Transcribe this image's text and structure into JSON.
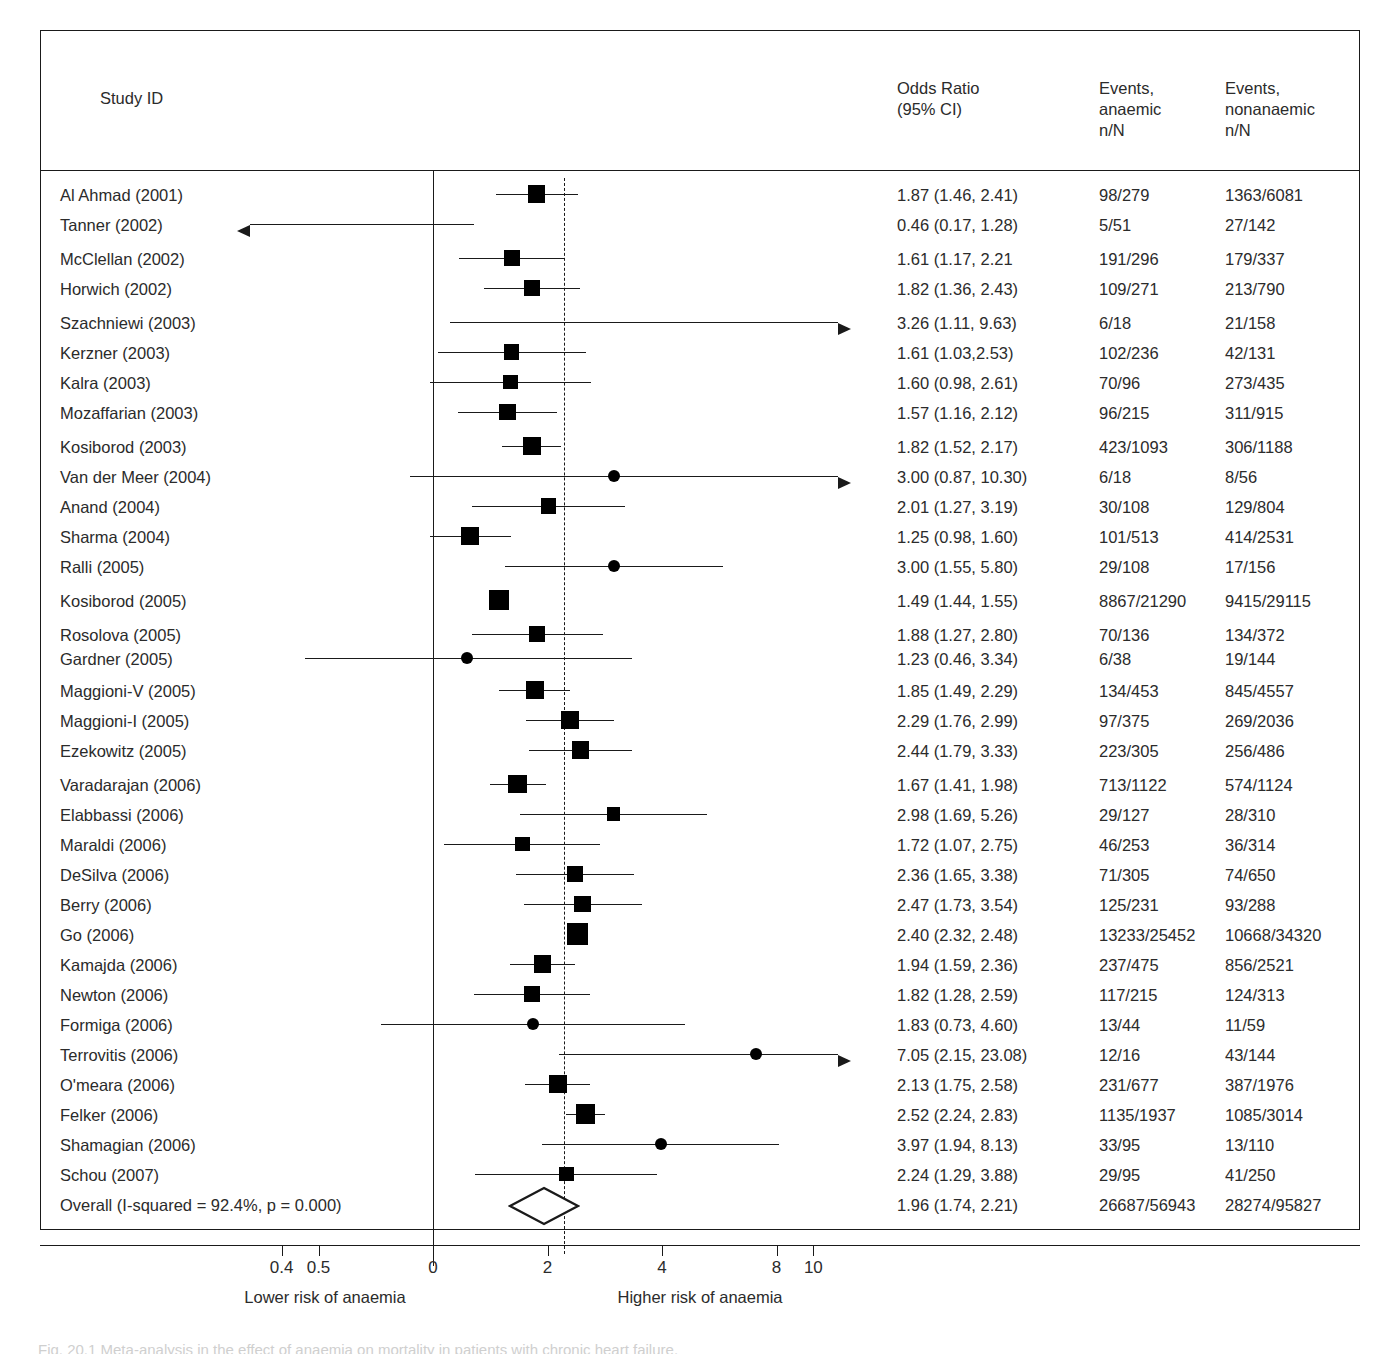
{
  "header": {
    "study_id": "Study ID",
    "odds_ratio": "Odds Ratio\n(95% CI)",
    "events_anaemic": "Events,\nanaemic\nn/N",
    "events_nonanaemic": "Events,\nnonanaemic\nn/N"
  },
  "axis": {
    "ticks": [
      {
        "label": "0.4",
        "value": 0.4
      },
      {
        "label": "0.5",
        "value": 0.5
      },
      {
        "label": "0",
        "value": 1
      },
      {
        "label": "2",
        "value": 2
      },
      {
        "label": "4",
        "value": 4
      },
      {
        "label": "8",
        "value": 8
      },
      {
        "label": "10",
        "value": 10
      }
    ],
    "left_label": "Lower risk of anaemia",
    "right_label": "Higher risk of anaemia",
    "no_effect_line": 1,
    "summary_line": 1.96
  },
  "caption": "Fig. 20.1  Meta-analysis in the effect of anaemia on mortality in patients with chronic heart failure.",
  "chart_data": {
    "type": "forest",
    "title": "",
    "xlabel": "Odds Ratio (95% CI)",
    "xscale": "log",
    "xlim": [
      0.33,
      12
    ],
    "grid": false,
    "effect_measure": "Odds Ratio",
    "rows": [
      {
        "study": "Al Ahmad (2001)",
        "or": 1.87,
        "lo": 1.46,
        "hi": 2.41,
        "or_text": "1.87 (1.46, 2.41)",
        "events_anaemic": "98/279",
        "events_nonanaemic": "1363/6081",
        "weight": 4.0,
        "marker": "square"
      },
      {
        "study": "Tanner (2002)",
        "or": 0.46,
        "lo": 0.17,
        "hi": 1.28,
        "or_text": "0.46 (0.17, 1.28)",
        "events_anaemic": "5/51",
        "events_nonanaemic": "27/142",
        "weight": 0.6,
        "marker": "none",
        "clip_left": true
      },
      {
        "study": "McClellan (2002)",
        "or": 1.61,
        "lo": 1.17,
        "hi": 2.21,
        "or_text": "1.61 (1.17, 2.21",
        "events_anaemic": "191/296",
        "events_nonanaemic": "179/337",
        "weight": 3.6,
        "marker": "square"
      },
      {
        "study": "Horwich (2002)",
        "or": 1.82,
        "lo": 1.36,
        "hi": 2.43,
        "or_text": "1.82 (1.36, 2.43)",
        "events_anaemic": "109/271",
        "events_nonanaemic": "213/790",
        "weight": 3.7,
        "marker": "square"
      },
      {
        "study": "Szachniewi (2003)",
        "or": 3.26,
        "lo": 1.11,
        "hi": 9.63,
        "or_text": "3.26 (1.11, 9.63)",
        "events_anaemic": "6/18",
        "events_nonanaemic": "21/158",
        "weight": 0.7,
        "marker": "none",
        "clip_right": true
      },
      {
        "study": "Kerzner (2003)",
        "or": 1.61,
        "lo": 1.03,
        "hi": 2.53,
        "or_text": "1.61 (1.03,2.53)",
        "events_anaemic": "102/236",
        "events_nonanaemic": "42/131",
        "weight": 3.3,
        "marker": "square"
      },
      {
        "study": "Kalra (2003)",
        "or": 1.6,
        "lo": 0.98,
        "hi": 2.61,
        "or_text": "1.60 (0.98, 2.61)",
        "events_anaemic": "70/96",
        "events_nonanaemic": "273/435",
        "weight": 3.1,
        "marker": "square"
      },
      {
        "study": "Mozaffarian (2003)",
        "or": 1.57,
        "lo": 1.16,
        "hi": 2.12,
        "or_text": "1.57 (1.16, 2.12)",
        "events_anaemic": "96/215",
        "events_nonanaemic": "311/915",
        "weight": 3.7,
        "marker": "square"
      },
      {
        "study": "Kosiborod (2003)",
        "or": 1.82,
        "lo": 1.52,
        "hi": 2.17,
        "or_text": "1.82 (1.52, 2.17)",
        "events_anaemic": "423/1093",
        "events_nonanaemic": "306/1188",
        "weight": 4.3,
        "marker": "square"
      },
      {
        "study": "Van der Meer (2004)",
        "or": 3.0,
        "lo": 0.87,
        "hi": 10.3,
        "or_text": "3.00 (0.87, 10.30)",
        "events_anaemic": "6/18",
        "events_nonanaemic": "8/56",
        "weight": 0.8,
        "marker": "circle",
        "clip_right": true
      },
      {
        "study": "Anand (2004)",
        "or": 2.01,
        "lo": 1.27,
        "hi": 3.19,
        "or_text": "2.01 (1.27, 3.19)",
        "events_anaemic": "30/108",
        "events_nonanaemic": "129/804",
        "weight": 3.3,
        "marker": "square"
      },
      {
        "study": "Sharma (2004)",
        "or": 1.25,
        "lo": 0.98,
        "hi": 1.6,
        "or_text": "1.25 (0.98, 1.60)",
        "events_anaemic": "101/513",
        "events_nonanaemic": "414/2531",
        "weight": 4.1,
        "marker": "square"
      },
      {
        "study": "Ralli (2005)",
        "or": 3.0,
        "lo": 1.55,
        "hi": 5.8,
        "or_text": "3.00 (1.55, 5.80)",
        "events_anaemic": "29/108",
        "events_nonanaemic": "17/156",
        "weight": 1.0,
        "marker": "circle"
      },
      {
        "study": "Kosiborod (2005)",
        "or": 1.49,
        "lo": 1.44,
        "hi": 1.55,
        "or_text": "1.49 (1.44, 1.55)",
        "events_anaemic": "8867/21290",
        "events_nonanaemic": "9415/29115",
        "weight": 4.8,
        "marker": "square"
      },
      {
        "study": "Rosolova (2005)",
        "or": 1.88,
        "lo": 1.27,
        "hi": 2.8,
        "or_text": "1.88 (1.27, 2.80)",
        "events_anaemic": "70/136",
        "events_nonanaemic": "134/372",
        "weight": 3.4,
        "marker": "square"
      },
      {
        "study": "Gardner (2005)",
        "or": 1.23,
        "lo": 0.46,
        "hi": 3.34,
        "or_text": "1.23 (0.46, 3.34)",
        "events_anaemic": "6/38",
        "events_nonanaemic": "19/144",
        "weight": 0.9,
        "marker": "circle"
      },
      {
        "study": "Maggioni-V (2005)",
        "or": 1.85,
        "lo": 1.49,
        "hi": 2.29,
        "or_text": "1.85 (1.49, 2.29)",
        "events_anaemic": "134/453",
        "events_nonanaemic": "845/4557",
        "weight": 4.1,
        "marker": "square"
      },
      {
        "study": "Maggioni-I (2005)",
        "or": 2.29,
        "lo": 1.76,
        "hi": 2.99,
        "or_text": "2.29 (1.76, 2.99)",
        "events_anaemic": "97/375",
        "events_nonanaemic": "269/2036",
        "weight": 4.0,
        "marker": "square"
      },
      {
        "study": "Ezekowitz (2005)",
        "or": 2.44,
        "lo": 1.79,
        "hi": 3.33,
        "or_text": "2.44 (1.79, 3.33)",
        "events_anaemic": "223/305",
        "events_nonanaemic": "256/486",
        "weight": 3.9,
        "marker": "square"
      },
      {
        "study": "Varadarajan (2006)",
        "or": 1.67,
        "lo": 1.41,
        "hi": 1.98,
        "or_text": "1.67 (1.41, 1.98)",
        "events_anaemic": "713/1122",
        "events_nonanaemic": "574/1124",
        "weight": 4.4,
        "marker": "square"
      },
      {
        "study": "Elabbassi (2006)",
        "or": 2.98,
        "lo": 1.69,
        "hi": 5.26,
        "or_text": "2.98 (1.69, 5.26)",
        "events_anaemic": "29/127",
        "events_nonanaemic": "28/310",
        "weight": 2.6,
        "marker": "square"
      },
      {
        "study": "Maraldi (2006)",
        "or": 1.72,
        "lo": 1.07,
        "hi": 2.75,
        "or_text": "1.72 (1.07, 2.75)",
        "events_anaemic": "46/253",
        "events_nonanaemic": "36/314",
        "weight": 3.1,
        "marker": "square"
      },
      {
        "study": "DeSilva (2006)",
        "or": 2.36,
        "lo": 1.65,
        "hi": 3.38,
        "or_text": "2.36 (1.65, 3.38)",
        "events_anaemic": "71/305",
        "events_nonanaemic": "74/650",
        "weight": 3.7,
        "marker": "square"
      },
      {
        "study": "Berry (2006)",
        "or": 2.47,
        "lo": 1.73,
        "hi": 3.54,
        "or_text": "2.47 (1.73, 3.54)",
        "events_anaemic": "125/231",
        "events_nonanaemic": "93/288",
        "weight": 3.8,
        "marker": "square"
      },
      {
        "study": "Go (2006)",
        "or": 2.4,
        "lo": 2.32,
        "hi": 2.48,
        "or_text": "2.40 (2.32, 2.48)",
        "events_anaemic": "13233/25452",
        "events_nonanaemic": "10668/34320",
        "weight": 5.2,
        "marker": "square"
      },
      {
        "study": "Kamajda (2006)",
        "or": 1.94,
        "lo": 1.59,
        "hi": 2.36,
        "or_text": "1.94 (1.59, 2.36)",
        "events_anaemic": "237/475",
        "events_nonanaemic": "856/2521",
        "weight": 4.1,
        "marker": "square"
      },
      {
        "study": "Newton (2006)",
        "or": 1.82,
        "lo": 1.28,
        "hi": 2.59,
        "or_text": "1.82 (1.28, 2.59)",
        "events_anaemic": "117/215",
        "events_nonanaemic": "124/313",
        "weight": 3.4,
        "marker": "square"
      },
      {
        "study": "Formiga (2006)",
        "or": 1.83,
        "lo": 0.73,
        "hi": 4.6,
        "or_text": "1.83 (0.73, 4.60)",
        "events_anaemic": "13/44",
        "events_nonanaemic": "11/59",
        "weight": 0.9,
        "marker": "circle"
      },
      {
        "study": "Terrovitis (2006)",
        "or": 7.05,
        "lo": 2.15,
        "hi": 23.08,
        "or_text": "7.05 (2.15, 23.08)",
        "events_anaemic": "12/16",
        "events_nonanaemic": "43/144",
        "weight": 1.0,
        "marker": "circle",
        "clip_right": true
      },
      {
        "study": "O'meara (2006)",
        "or": 2.13,
        "lo": 1.75,
        "hi": 2.58,
        "or_text": "2.13 (1.75, 2.58)",
        "events_anaemic": "231/677",
        "events_nonanaemic": "387/1976",
        "weight": 4.2,
        "marker": "square"
      },
      {
        "study": "Felker (2006)",
        "or": 2.52,
        "lo": 2.24,
        "hi": 2.83,
        "or_text": "2.52 (2.24, 2.83)",
        "events_anaemic": "1135/1937",
        "events_nonanaemic": "1085/3014",
        "weight": 4.6,
        "marker": "square"
      },
      {
        "study": "Shamagian (2006)",
        "or": 3.97,
        "lo": 1.94,
        "hi": 8.13,
        "or_text": "3.97 (1.94, 8.13)",
        "events_anaemic": "33/95",
        "events_nonanaemic": "13/110",
        "weight": 1.1,
        "marker": "circle"
      },
      {
        "study": "Schou (2007)",
        "or": 2.24,
        "lo": 1.29,
        "hi": 3.88,
        "or_text": "2.24 (1.29, 3.88)",
        "events_anaemic": "29/95",
        "events_nonanaemic": "41/250",
        "weight": 3.1,
        "marker": "square"
      }
    ],
    "overall": {
      "study": "Overall (I-squared = 92.4%, p = 0.000)",
      "or": 1.96,
      "lo": 1.74,
      "hi": 2.21,
      "or_text": "1.96 (1.74, 2.21)",
      "events_anaemic": "26687/56943",
      "events_nonanaemic": "28274/95827",
      "i_squared": "92.4%",
      "p_value": "0.000",
      "marker": "diamond"
    }
  }
}
